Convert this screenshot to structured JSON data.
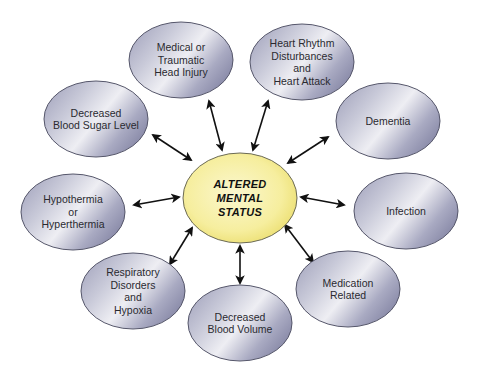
{
  "diagram": {
    "type": "hub-and-spoke",
    "center": {
      "label": "ALTERED\nMENTAL\nSTATUS",
      "cx": 240,
      "cy": 198,
      "rx": 57,
      "ry": 45,
      "fill": "#f7f0a0"
    },
    "nodes": [
      {
        "id": "head-injury",
        "label": "Medical or\nTraumatic\nHead Injury",
        "cx": 181,
        "cy": 60
      },
      {
        "id": "heart",
        "label": "Heart Rhythm\nDisturbances\nand\nHeart Attack",
        "cx": 302,
        "cy": 62
      },
      {
        "id": "blood-sugar",
        "label": "Decreased\nBlood Sugar Level",
        "cx": 96,
        "cy": 119
      },
      {
        "id": "dementia",
        "label": "Dementia",
        "cx": 388,
        "cy": 121
      },
      {
        "id": "temperature",
        "label": "Hypothermia\nor\nHyperthermia",
        "cx": 73,
        "cy": 212
      },
      {
        "id": "infection",
        "label": "Infection",
        "cx": 406,
        "cy": 211
      },
      {
        "id": "respiratory",
        "label": "Respiratory\nDisorders\nand\nHypoxia",
        "cx": 133,
        "cy": 291
      },
      {
        "id": "medication",
        "label": "Medication\nRelated",
        "cx": 348,
        "cy": 289
      },
      {
        "id": "blood-volume",
        "label": "Decreased\nBlood Volume",
        "cx": 240,
        "cy": 323
      }
    ],
    "node_rx": 52,
    "node_ry": 38,
    "node_fill": "#b8b9cf",
    "node_stroke": "#55566a",
    "arrow_color": "#111111",
    "arrows": [
      {
        "to": "head-injury",
        "x1": 222,
        "y1": 150,
        "x2": 209,
        "y2": 101
      },
      {
        "to": "heart",
        "x1": 253,
        "y1": 150,
        "x2": 268,
        "y2": 101
      },
      {
        "to": "blood-sugar",
        "x1": 191,
        "y1": 160,
        "x2": 153,
        "y2": 135
      },
      {
        "to": "dementia",
        "x1": 288,
        "y1": 163,
        "x2": 328,
        "y2": 137
      },
      {
        "to": "temperature",
        "x1": 179,
        "y1": 197,
        "x2": 134,
        "y2": 205
      },
      {
        "to": "infection",
        "x1": 301,
        "y1": 197,
        "x2": 344,
        "y2": 205
      },
      {
        "to": "respiratory",
        "x1": 192,
        "y1": 228,
        "x2": 170,
        "y2": 264
      },
      {
        "to": "medication",
        "x1": 285,
        "y1": 225,
        "x2": 313,
        "y2": 262
      },
      {
        "to": "blood-volume",
        "x1": 240,
        "y1": 246,
        "x2": 240,
        "y2": 283
      }
    ]
  }
}
